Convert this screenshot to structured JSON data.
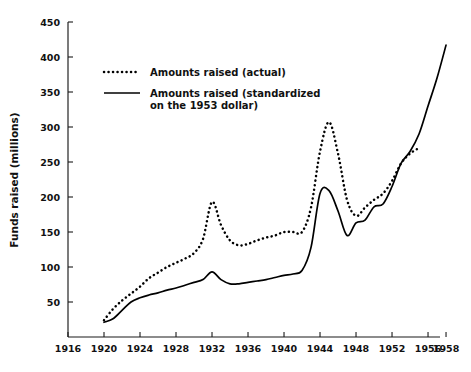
{
  "chart_data": {
    "type": "line",
    "title": "",
    "xlabel": "",
    "ylabel": "Funds raised (millions)",
    "xlim": [
      1916,
      1959
    ],
    "ylim": [
      0,
      450
    ],
    "grid": false,
    "legend_position": "upper-left-inside",
    "x_ticks": [
      1916,
      1920,
      1924,
      1928,
      1932,
      1936,
      1940,
      1944,
      1948,
      1952,
      1956,
      1958
    ],
    "y_ticks": [
      50,
      100,
      150,
      200,
      250,
      300,
      350,
      400,
      450
    ],
    "series": [
      {
        "name": "Amounts raised (actual)",
        "style": "dotted",
        "x": [
          1920,
          1921,
          1922,
          1923,
          1924,
          1925,
          1926,
          1927,
          1928,
          1929,
          1930,
          1931,
          1932,
          1933,
          1934,
          1935,
          1936,
          1937,
          1938,
          1939,
          1940,
          1941,
          1942,
          1943,
          1944,
          1945,
          1946,
          1947,
          1948,
          1949,
          1950,
          1951,
          1952,
          1953,
          1954,
          1955
        ],
        "values": [
          24,
          40,
          52,
          62,
          72,
          84,
          92,
          100,
          106,
          112,
          120,
          140,
          193,
          160,
          138,
          131,
          133,
          138,
          142,
          145,
          150,
          150,
          150,
          185,
          265,
          307,
          262,
          196,
          173,
          185,
          196,
          205,
          223,
          248,
          262,
          270
        ]
      },
      {
        "name": "Amounts raised (standardized on the 1953 dollar)",
        "style": "solid",
        "x": [
          1920,
          1921,
          1922,
          1923,
          1924,
          1925,
          1926,
          1927,
          1928,
          1929,
          1930,
          1931,
          1932,
          1933,
          1934,
          1935,
          1936,
          1937,
          1938,
          1939,
          1940,
          1941,
          1942,
          1943,
          1944,
          1945,
          1946,
          1947,
          1948,
          1949,
          1950,
          1951,
          1952,
          1953,
          1954,
          1955,
          1956,
          1957,
          1958
        ],
        "values": [
          21,
          26,
          38,
          50,
          56,
          60,
          63,
          67,
          70,
          74,
          78,
          82,
          93,
          82,
          76,
          76,
          78,
          80,
          82,
          85,
          88,
          90,
          95,
          128,
          205,
          209,
          180,
          145,
          163,
          167,
          186,
          190,
          215,
          248,
          265,
          290,
          330,
          370,
          417
        ]
      }
    ],
    "legend": [
      {
        "label_line1": "Amounts raised (actual)",
        "label_line2": "",
        "style": "dotted"
      },
      {
        "label_line1": "Amounts raised (standardized",
        "label_line2": "on the 1953 dollar)",
        "style": "solid"
      }
    ],
    "colors": {
      "series": "#000000",
      "axis": "#1a1a1a",
      "background": "#ffffff"
    }
  },
  "geometry": {
    "plot_left": 68,
    "plot_right": 440,
    "plot_top": 22,
    "plot_bottom": 337,
    "x_min": 1916,
    "x_max": 1957.33,
    "y_min": 0,
    "y_max": 450
  }
}
